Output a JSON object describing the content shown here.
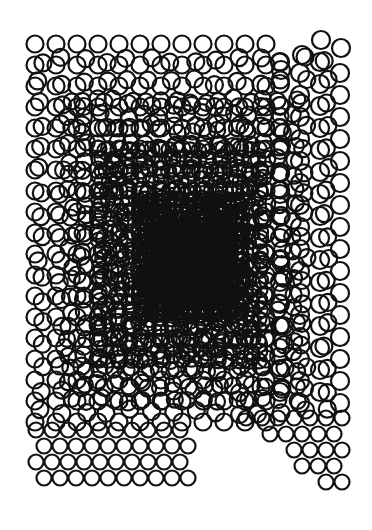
{
  "artwork": {
    "kind": "generative circle grid",
    "background": "#ffffff",
    "stroke_color": "#111111",
    "stroke_width": 2.2,
    "canvas": {
      "width": 372,
      "height": 530
    },
    "layers": [
      {
        "name": "base-grid",
        "x0": 35,
        "y0": 44,
        "dx": 21,
        "dy": 21,
        "cols": 12,
        "rows": 19,
        "r": 8.5,
        "jitter": 0
      },
      {
        "name": "right-columns",
        "x0": 280,
        "y0": 62,
        "dx": 20,
        "dy": 22,
        "cols": 4,
        "rows": 16,
        "r": 9,
        "jitter": 0,
        "stagger": 11
      },
      {
        "name": "overlap-ring-1",
        "x0": 40,
        "y0": 60,
        "dx": 22,
        "dy": 22,
        "cols": 14,
        "rows": 17,
        "r": 8.5,
        "jitter": 3
      },
      {
        "name": "overlap-ring-2",
        "x0": 70,
        "y0": 100,
        "dx": 15,
        "dy": 15,
        "cols": 16,
        "rows": 21,
        "r": 8,
        "jitter": 3
      },
      {
        "name": "overlap-ring-3",
        "x0": 100,
        "y0": 150,
        "dx": 10,
        "dy": 10,
        "cols": 17,
        "rows": 22,
        "r": 7.5,
        "jitter": 2
      },
      {
        "name": "dense-core",
        "x0": 140,
        "y0": 200,
        "dx": 6,
        "dy": 6,
        "cols": 18,
        "rows": 20,
        "r": 7,
        "jitter": 1.5
      },
      {
        "name": "darkest-core",
        "x0": 160,
        "y0": 230,
        "dx": 4,
        "dy": 4,
        "cols": 18,
        "rows": 18,
        "r": 6,
        "jitter": 1
      }
    ],
    "bottom_left_stagger": {
      "y_start": 430,
      "y_end": 492,
      "row_dy": 16,
      "dx": 16,
      "r": 7.5,
      "x_start": 36,
      "x_end_top": 185,
      "x_end_bottom": 228
    },
    "bottom_right_triangle": {
      "x_start": 240,
      "x_end": 342,
      "y_top": 418,
      "y_bottom": 492,
      "dx": 16,
      "dy": 16,
      "r": 7.5
    },
    "top_right_extras": [
      [
        302,
        55
      ],
      [
        321,
        40
      ],
      [
        341,
        48
      ],
      [
        281,
        70
      ]
    ]
  }
}
